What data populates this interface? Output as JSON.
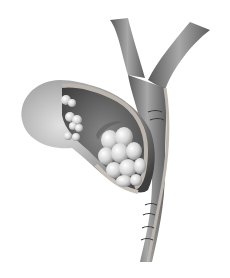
{
  "image": {
    "subject": "Grayscale medical illustration of a cut-open gallbladder containing gallstones, with bile ducts",
    "alt": "Cutaway gallbladder with gallstones in the neck and small stones in the fundus, connected to branching bile ducts",
    "colors": {
      "background": "#ffffff",
      "wall_light": "#d9d9d9",
      "wall_mid": "#9a9a9a",
      "wall_dark": "#4a4a4a",
      "interior": "#6e6e6e",
      "stone_light": "#f0f0f0",
      "stone_shadow": "#8a8a8a",
      "cut_edge": "#bdb6ae"
    }
  }
}
